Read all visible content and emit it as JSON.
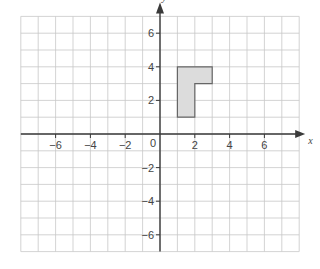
{
  "diagram": {
    "type": "coordinate-grid",
    "x_axis_label": "x",
    "y_axis_label": "y",
    "origin_label": "0",
    "x_range": [
      -8,
      8
    ],
    "y_range": [
      -7,
      7
    ],
    "grid_step": 1,
    "x_tick_labels": [
      {
        "value": -6,
        "text": "−6"
      },
      {
        "value": -4,
        "text": "−4"
      },
      {
        "value": -2,
        "text": "−2"
      },
      {
        "value": 2,
        "text": "2"
      },
      {
        "value": 4,
        "text": "4"
      },
      {
        "value": 6,
        "text": "6"
      }
    ],
    "y_tick_labels": [
      {
        "value": 6,
        "text": "6"
      },
      {
        "value": 4,
        "text": "4"
      },
      {
        "value": 2,
        "text": "2"
      },
      {
        "value": -2,
        "text": "−2"
      },
      {
        "value": -4,
        "text": "−4"
      },
      {
        "value": -6,
        "text": "−6"
      }
    ],
    "shape": {
      "name": "L-shape",
      "fill": "#dcdcdc",
      "stroke": "#666666",
      "vertices": [
        [
          1,
          4
        ],
        [
          3,
          4
        ],
        [
          3,
          3
        ],
        [
          2,
          3
        ],
        [
          2,
          1
        ],
        [
          1,
          1
        ]
      ]
    }
  }
}
